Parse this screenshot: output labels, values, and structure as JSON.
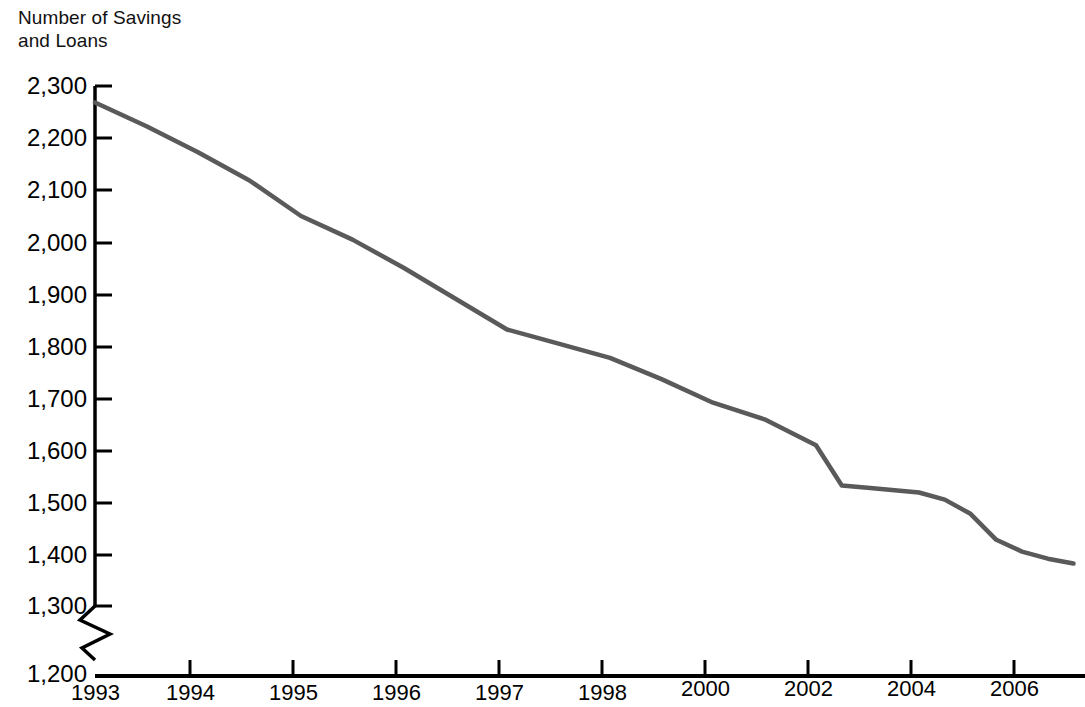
{
  "chart_data": {
    "type": "line",
    "title_line1": "Number of Savings",
    "title_line2": "and Loans",
    "xlabel": "",
    "ylabel": "Number of Savings and Loans",
    "grid": false,
    "legend": "none",
    "line_color": "#5a5a5a",
    "axis_color": "#000000",
    "axis_break": true,
    "axis_break_note": "y-axis broken between 0 and 1,200",
    "ylim": [
      1150,
      2300
    ],
    "yticks": [
      2300,
      2200,
      2100,
      2000,
      1900,
      1800,
      1700,
      1600,
      1500,
      1400,
      1300,
      1200,
      0
    ],
    "ytick_labels": [
      "2,300",
      "2,200",
      "2,100",
      "2,000",
      "1,900",
      "1,800",
      "1,700",
      "1,600",
      "1,500",
      "1,400",
      "1,300",
      "1,200",
      "0"
    ],
    "xticks": [
      1993,
      1994,
      1995,
      1996,
      1997,
      1998,
      2000,
      2002,
      2004,
      2006
    ],
    "xtick_labels": [
      "1993",
      "1994",
      "1995",
      "1996",
      "1997",
      "1998",
      "2000",
      "2002",
      "2004",
      "2006"
    ],
    "x": [
      1993,
      1993.5,
      1994,
      1994.5,
      1995,
      1995.5,
      1996,
      1996.5,
      1997,
      1997.5,
      1998,
      1999,
      2000,
      2001,
      2002,
      2002.5,
      2003,
      2004,
      2004.5,
      2005,
      2005.5,
      2006,
      2006.5,
      2007
    ],
    "values": [
      2265,
      2215,
      2160,
      2100,
      2025,
      1975,
      1915,
      1850,
      1785,
      1755,
      1725,
      1680,
      1630,
      1595,
      1540,
      1455,
      1450,
      1440,
      1425,
      1395,
      1340,
      1315,
      1300,
      1290
    ],
    "series": [
      {
        "name": "Number of Savings and Loans",
        "values": [
          2265,
          2215,
          2160,
          2100,
          2025,
          1975,
          1915,
          1850,
          1785,
          1755,
          1725,
          1680,
          1630,
          1595,
          1540,
          1455,
          1450,
          1440,
          1425,
          1395,
          1340,
          1315,
          1300,
          1290
        ]
      }
    ],
    "annotated_points": [
      {
        "year": "1993",
        "value": 2265
      },
      {
        "year": "1994",
        "value": 2160
      },
      {
        "year": "1995",
        "value": 2025
      },
      {
        "year": "1996",
        "value": 1915
      },
      {
        "year": "1997",
        "value": 1785
      },
      {
        "year": "1998",
        "value": 1725
      },
      {
        "year": "2000",
        "value": 1630
      },
      {
        "year": "2002",
        "value": 1455
      },
      {
        "year": "2004",
        "value": 1440
      },
      {
        "year": "2006",
        "value": 1300
      }
    ]
  }
}
